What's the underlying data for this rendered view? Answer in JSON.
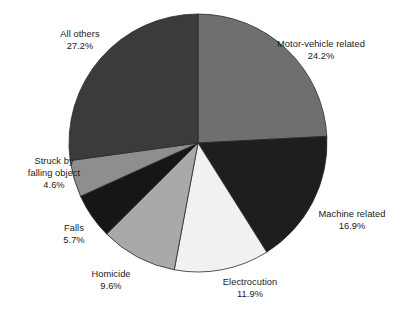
{
  "chart_data": {
    "type": "pie",
    "title": "",
    "subtitle": "",
    "xlabel": "",
    "ylabel": "",
    "legend_position": "none",
    "grid": false,
    "units": "percent",
    "start_angle_deg": 0,
    "direction": "clockwise",
    "categories": [
      "Motor-vehicle related",
      "Machine related",
      "Electrocution",
      "Homicide",
      "Falls",
      "Struck by falling object",
      "All others"
    ],
    "values": [
      24.2,
      16.9,
      11.9,
      9.6,
      5.7,
      4.6,
      27.2
    ],
    "value_labels": [
      "24.2%",
      "16.9%",
      "11.9%",
      "9.6%",
      "5.7%",
      "4.6%",
      "27.2%"
    ],
    "colors": [
      "#6f6f6f",
      "#1e1e1e",
      "#f1f1f1",
      "#a9a9a9",
      "#161616",
      "#8e8e8e",
      "#3b3b3b"
    ],
    "slices": [
      {
        "name": "Motor-vehicle related",
        "name_lines": [
          "Motor-vehicle related"
        ],
        "value": 24.2,
        "value_label": "24.2%",
        "color": "#6f6f6f"
      },
      {
        "name": "Machine related",
        "name_lines": [
          "Machine related"
        ],
        "value": 16.9,
        "value_label": "16.9%",
        "color": "#1e1e1e"
      },
      {
        "name": "Electrocution",
        "name_lines": [
          "Electrocution"
        ],
        "value": 11.9,
        "value_label": "11.9%",
        "color": "#f1f1f1"
      },
      {
        "name": "Homicide",
        "name_lines": [
          "Homicide"
        ],
        "value": 9.6,
        "value_label": "9.6%",
        "color": "#a9a9a9"
      },
      {
        "name": "Falls",
        "name_lines": [
          "Falls"
        ],
        "value": 5.7,
        "value_label": "5.7%",
        "color": "#161616"
      },
      {
        "name": "Struck by falling object",
        "name_lines": [
          "Struck by",
          "falling object"
        ],
        "value": 4.6,
        "value_label": "4.6%",
        "color": "#8e8e8e"
      },
      {
        "name": "All others",
        "name_lines": [
          "All others"
        ],
        "value": 27.2,
        "value_label": "27.2%",
        "color": "#3b3b3b"
      }
    ],
    "geometry": {
      "center_x": 198,
      "center_y": 143,
      "radius": 129
    },
    "styles": {
      "background": "#ffffff",
      "label_color": "#1a1a1a",
      "slice_stroke": "#2b2b2b"
    }
  }
}
